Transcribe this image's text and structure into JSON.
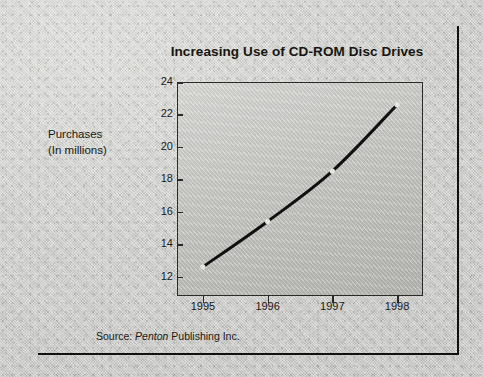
{
  "figure": {
    "title": "Increasing Use of CD-ROM Disc Drives",
    "axis_title_line1": "Purchases",
    "axis_title_line2": "(In millions)",
    "source_prefix": "Source:",
    "source_publisher": "Penton",
    "source_suffix": "Publishing Inc.",
    "ink_color": "#17150f",
    "plot_border_color": "#2c2a26",
    "line_color": "#111010",
    "paper_color": "#c9c9c7"
  },
  "chart_data": {
    "type": "line",
    "title": "Increasing Use of CD-ROM Disc Drives",
    "xlabel": "",
    "ylabel": "Purchases (In millions)",
    "x": [
      1995,
      1996,
      1997,
      1998
    ],
    "values": [
      12.6,
      15.4,
      18.5,
      22.6
    ],
    "series": [
      {
        "name": "Purchases (In millions)",
        "values": [
          12.6,
          15.4,
          18.5,
          22.6
        ]
      }
    ],
    "xtick_labels": [
      "1995",
      "1996",
      "1997",
      "1998"
    ],
    "ytick_labels": [
      "24",
      "22",
      "20",
      "18",
      "16",
      "14",
      "12"
    ],
    "ytick_values": [
      24,
      22,
      20,
      18,
      16,
      14,
      12
    ],
    "ylim": [
      10.8,
      24
    ],
    "xlim": [
      1994.6,
      1998.4
    ],
    "grid": false,
    "legend": false,
    "markers": true,
    "annotation": "Source: Penton Publishing Inc."
  }
}
